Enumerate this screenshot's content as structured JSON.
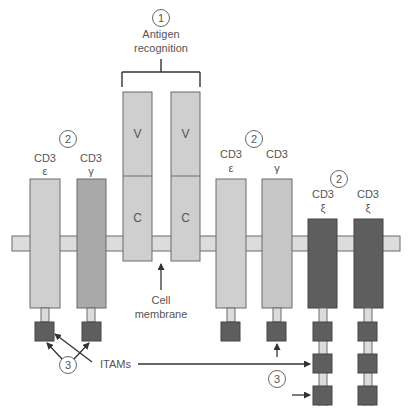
{
  "callouts": {
    "one": "1",
    "two": "2",
    "three": "3"
  },
  "labels": {
    "antigen_line1": "Antigen",
    "antigen_line2": "recognition",
    "cell_line1": "Cell",
    "cell_line2": "membrane",
    "itams": "ITAMs"
  },
  "chains": {
    "tcr_left": {
      "v": "V",
      "c": "C"
    },
    "tcr_right": {
      "v": "V",
      "c": "C"
    },
    "cd3_epsilon_left": {
      "name": "CD3",
      "greek": "ε"
    },
    "cd3_gamma_left": {
      "name": "CD3",
      "greek": "γ"
    },
    "cd3_epsilon_right": {
      "name": "CD3",
      "greek": "ε"
    },
    "cd3_gamma_right": {
      "name": "CD3",
      "greek": "γ"
    },
    "cd3_xi_left": {
      "name": "CD3",
      "greek": "ξ"
    },
    "cd3_xi_right": {
      "name": "CD3",
      "greek": "ξ"
    }
  },
  "colors": {
    "light_chain": "#cfcfcf",
    "medium_chain": "#a9a9a9",
    "dark_chain": "#5e5e5e",
    "itam": "#5e5e5e",
    "membrane": "#dcdcdc",
    "stroke": "#6a6a6a",
    "text": "#555555"
  }
}
